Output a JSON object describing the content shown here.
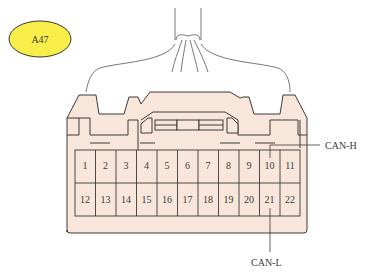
{
  "connector": {
    "id": "A47",
    "badge_color": "#f7ee4a",
    "body_fill": "#f8e6da",
    "outline_color": "#3a3a3a",
    "pins_row1": [
      "1",
      "2",
      "3",
      "4",
      "5",
      "6",
      "7",
      "8",
      "9",
      "10",
      "11"
    ],
    "pins_row2": [
      "12",
      "13",
      "14",
      "15",
      "16",
      "17",
      "18",
      "19",
      "20",
      "21",
      "22"
    ]
  },
  "callouts": {
    "can_h": {
      "label": "CAN-H",
      "pin": "10"
    },
    "can_l": {
      "label": "CAN-L",
      "pin": "21"
    }
  }
}
